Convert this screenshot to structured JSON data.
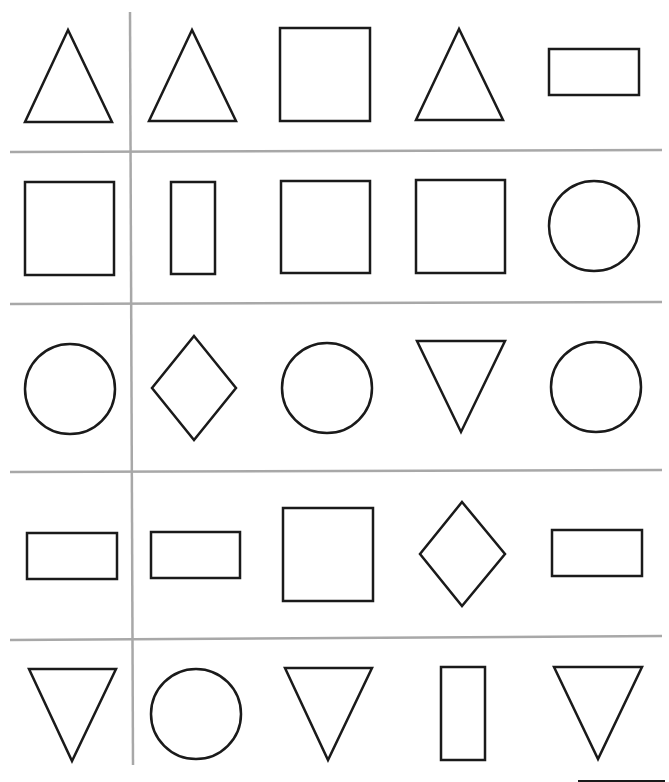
{
  "worksheet": {
    "title": "",
    "grid": {
      "rows": 5,
      "cols": 5
    },
    "line_color": "#a8a8a8",
    "stroke_color": "#1a1a1a",
    "rows": [
      [
        "triangle-up",
        "triangle-up",
        "square",
        "triangle-up",
        "rectangle-wide"
      ],
      [
        "square",
        "rectangle-tall",
        "square",
        "square",
        "circle"
      ],
      [
        "circle",
        "diamond",
        "circle",
        "triangle-down",
        "circle"
      ],
      [
        "rectangle-wide",
        "rectangle-wide",
        "square",
        "diamond",
        "rectangle-wide"
      ],
      [
        "triangle-down",
        "circle",
        "triangle-down",
        "rectangle-tall",
        "triangle-down"
      ]
    ]
  }
}
